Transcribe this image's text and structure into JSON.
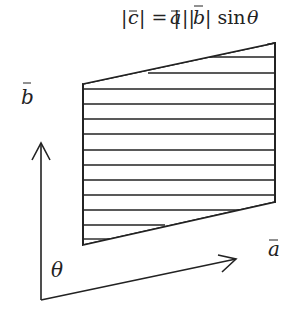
{
  "title": {
    "formula_parts": [
      "|",
      "c",
      "| = |",
      "a",
      "||",
      "b",
      "| sin ",
      "θ"
    ],
    "text": "|c⃗| = |a⃗||b⃗| sin θ"
  },
  "labels": {
    "vector_b": "b",
    "vector_a": "a",
    "angle": "θ"
  },
  "colors": {
    "stroke": "#222222",
    "background": "#ffffff"
  },
  "geometry": {
    "parallelogram": {
      "top_left": [
        83,
        84
      ],
      "top_right": [
        275,
        43
      ],
      "bottom_right": [
        275,
        202
      ],
      "bottom_left": [
        83,
        245
      ]
    },
    "hatch_line_count": 11,
    "origin": [
      41,
      300
    ],
    "vector_b_tip": [
      41,
      143
    ],
    "vector_a_tip": [
      236,
      259
    ]
  }
}
